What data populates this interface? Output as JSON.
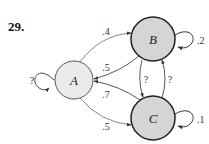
{
  "problem": {
    "number": "29."
  },
  "diagram": {
    "type": "markov-chain-state-diagram",
    "colors": {
      "node_a_fill": "#ebebeb",
      "node_bc_fill": "#d5d5d5",
      "node_stroke": "#222222",
      "edge_stroke": "#555555"
    },
    "nodes": [
      {
        "id": "A",
        "label": "A"
      },
      {
        "id": "B",
        "label": "B"
      },
      {
        "id": "C",
        "label": "C"
      }
    ],
    "edges": [
      {
        "from": "A",
        "to": "A",
        "label": "?"
      },
      {
        "from": "A",
        "to": "B",
        "label": ".4"
      },
      {
        "from": "A",
        "to": "C",
        "label": ".5"
      },
      {
        "from": "B",
        "to": "A",
        "label": ".5"
      },
      {
        "from": "B",
        "to": "B",
        "label": ".2"
      },
      {
        "from": "B",
        "to": "C",
        "label": "?"
      },
      {
        "from": "C",
        "to": "A",
        "label": ".7"
      },
      {
        "from": "C",
        "to": "B",
        "label": "?"
      },
      {
        "from": "C",
        "to": "C",
        "label": ".1"
      }
    ]
  }
}
